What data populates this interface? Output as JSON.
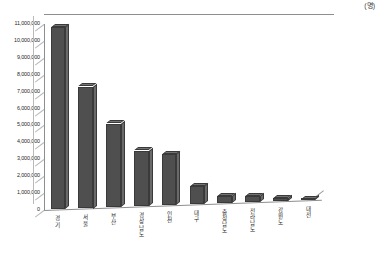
{
  "unit_note": "(명)",
  "chart_data": {
    "type": "bar",
    "title": "",
    "subtitle": "",
    "xlabel": "",
    "ylabel": "",
    "unit": "(명)",
    "grid": true,
    "legend": false,
    "three_d": true,
    "ylim": [
      0,
      11000000
    ],
    "ytick_labels": [
      "11,000,000",
      "10,000,000",
      "9,000,000",
      "8,000,000",
      "7,000,000",
      "6,000,000",
      "5,000,000",
      "4,000,000",
      "3,000,000",
      "2,000,000",
      "1,000,000",
      "0"
    ],
    "ytick_values": [
      11000000,
      10000000,
      9000000,
      8000000,
      7000000,
      6000000,
      5000000,
      4000000,
      3000000,
      2000000,
      1000000,
      0
    ],
    "categories": [
      "경기",
      "서울",
      "부산",
      "경상남도",
      "인천",
      "대구",
      "충청남도",
      "전라남도",
      "강원도",
      "대전"
    ],
    "values": [
      10800000,
      7300000,
      5100000,
      3500000,
      3300000,
      1400000,
      800000,
      800000,
      700000,
      650000
    ],
    "bar_color": "#4f4f4f",
    "bar_side_color": "#6a6a6a",
    "bar_top_color": "#737373",
    "grid_color": "#b9b9b9",
    "axis_color": "#8e8e8e",
    "background": "#ffffff"
  }
}
